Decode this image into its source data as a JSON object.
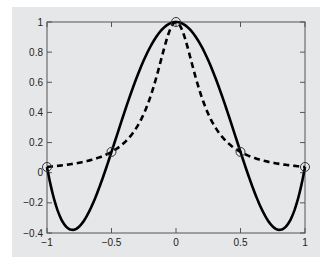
{
  "chart_data": {
    "type": "line",
    "title": "",
    "xlabel": "",
    "ylabel": "",
    "xlim": [
      -1,
      1
    ],
    "ylim": [
      -0.4,
      1
    ],
    "grid": false,
    "legend": null,
    "x_ticks": [
      "-1",
      "-0.5",
      "0",
      "0.5",
      "1"
    ],
    "y_ticks": [
      "-0.4",
      "-0.2",
      "0",
      "0.2",
      "0.4",
      "0.6",
      "0.8",
      "1"
    ],
    "series": [
      {
        "name": "Runge function 1/(1+25x^2)",
        "style": "dashed",
        "color": "#000000",
        "x": [
          -1,
          -0.9,
          -0.8,
          -0.7,
          -0.6,
          -0.5,
          -0.4,
          -0.3,
          -0.2,
          -0.1,
          0,
          0.1,
          0.2,
          0.3,
          0.4,
          0.5,
          0.6,
          0.7,
          0.8,
          0.9,
          1
        ],
        "values": [
          0.038,
          0.047,
          0.059,
          0.075,
          0.1,
          0.138,
          0.2,
          0.308,
          0.5,
          0.8,
          1.0,
          0.8,
          0.5,
          0.308,
          0.2,
          0.138,
          0.1,
          0.075,
          0.059,
          0.047,
          0.038
        ]
      },
      {
        "name": "4th-order interpolating polynomial",
        "style": "solid",
        "color": "#000000",
        "x": [
          -1,
          -0.9,
          -0.8,
          -0.7,
          -0.6,
          -0.5,
          -0.4,
          -0.3,
          -0.2,
          -0.1,
          0,
          0.1,
          0.2,
          0.3,
          0.4,
          0.5,
          0.6,
          0.7,
          0.8,
          0.9,
          1
        ],
        "values": [
          0.038,
          -0.288,
          -0.379,
          -0.3,
          -0.11,
          0.138,
          0.401,
          0.642,
          0.834,
          0.958,
          1.0,
          0.958,
          0.834,
          0.642,
          0.401,
          0.138,
          -0.11,
          -0.3,
          -0.379,
          -0.288,
          0.038
        ]
      },
      {
        "name": "interpolation nodes",
        "style": "markers",
        "marker": "open-circle",
        "x": [
          -1,
          -0.5,
          0,
          0.5,
          1
        ],
        "values": [
          0.038,
          0.138,
          1.0,
          0.138,
          0.038
        ]
      }
    ]
  }
}
